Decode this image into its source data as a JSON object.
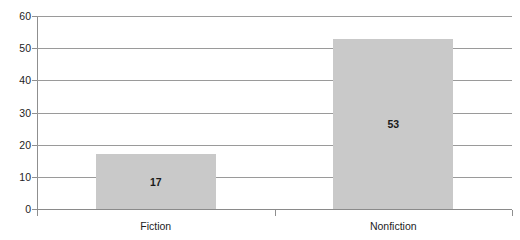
{
  "chart_data": {
    "type": "bar",
    "title": "",
    "subtitle": "",
    "xlabel": "",
    "ylabel": "",
    "categories": [
      "Fiction",
      "Nonfiction"
    ],
    "values": [
      17,
      53
    ],
    "value_labels": [
      "17",
      "53"
    ],
    "ylim": [
      0,
      60
    ],
    "y_ticks": [
      0,
      10,
      20,
      30,
      40,
      50,
      60
    ],
    "y_tick_labels": [
      "0",
      "10",
      "20",
      "30",
      "40",
      "50",
      "60"
    ],
    "grid": true,
    "legend": false,
    "legend_position": "none",
    "bar_color": "#c9c9c9",
    "gridline_color": "#9a9a9a",
    "axis_color": "#8f8f8f",
    "text_color": "#1d1d1d",
    "background": "#ffffff"
  }
}
